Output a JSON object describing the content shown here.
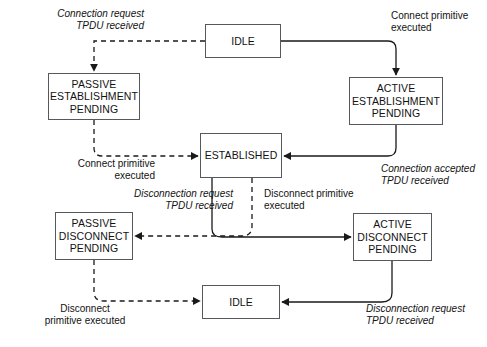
{
  "diagram": {
    "type": "state-transition-diagram",
    "colors": {
      "box_border": "#55585c",
      "solid_edge": "#1a1a1a",
      "dashed_edge": "#1a1a1a",
      "background": "#ffffff",
      "text": "#121212"
    },
    "legend": {
      "solid_edge_meaning": "transitions caused by local actions",
      "dashed_edge_meaning": "transitions caused by remote events"
    },
    "states": [
      {
        "id": "idle-top",
        "lines": [
          "IDLE"
        ],
        "x": 205,
        "y": 24,
        "w": 76,
        "h": 34
      },
      {
        "id": "passive-establishment-pending",
        "lines": [
          "PASSIVE",
          "ESTABLISHMENT",
          "PENDING"
        ],
        "x": 48,
        "y": 73,
        "w": 92,
        "h": 47
      },
      {
        "id": "active-establishment-pending",
        "lines": [
          "ACTIVE",
          "ESTABLISHMENT",
          "PENDING"
        ],
        "x": 349,
        "y": 77,
        "w": 94,
        "h": 48
      },
      {
        "id": "established",
        "lines": [
          "ESTABLISHED"
        ],
        "x": 200,
        "y": 133,
        "w": 82,
        "h": 45
      },
      {
        "id": "passive-disconnect-pending",
        "lines": [
          "PASSIVE",
          "DISCONNECT",
          "PENDING"
        ],
        "x": 55,
        "y": 212,
        "w": 78,
        "h": 48
      },
      {
        "id": "active-disconnect-pending",
        "lines": [
          "ACTIVE",
          "DISCONNECT",
          "PENDING"
        ],
        "x": 353,
        "y": 213,
        "w": 79,
        "h": 48
      },
      {
        "id": "idle-bottom",
        "lines": [
          "IDLE"
        ],
        "x": 202,
        "y": 285,
        "w": 78,
        "h": 34
      }
    ],
    "labels": [
      {
        "id": "connection-request-tpdu-received",
        "lines": [
          "Connection request",
          "TPDU received"
        ],
        "italic": true,
        "align": "right",
        "x": 14,
        "y": 8,
        "w": 130
      },
      {
        "id": "connect-primitive-executed-top",
        "lines": [
          "Connect primitive",
          "executed"
        ],
        "italic": false,
        "align": "left",
        "x": 391,
        "y": 10,
        "w": 96
      },
      {
        "id": "connect-primitive-executed-left",
        "lines": [
          "Connect primitive",
          "executed"
        ],
        "italic": false,
        "align": "right",
        "x": 45,
        "y": 158,
        "w": 110
      },
      {
        "id": "connection-accepted-tpdu-received",
        "lines": [
          "Connection accepted",
          "TPDU received"
        ],
        "italic": true,
        "align": "left",
        "x": 381,
        "y": 163,
        "w": 106
      },
      {
        "id": "disconnection-request-tpdu-received-mid",
        "lines": [
          "Disconnection request",
          "TPDU received"
        ],
        "italic": true,
        "align": "right",
        "x": 112,
        "y": 188,
        "w": 121
      },
      {
        "id": "disconnect-primitive-executed-mid",
        "lines": [
          "Disconnect primitive",
          "executed"
        ],
        "italic": false,
        "align": "left",
        "x": 264,
        "y": 188,
        "w": 112
      },
      {
        "id": "disconnect-primitive-executed-bottom",
        "lines": [
          "Disconnect",
          "primitive executed"
        ],
        "italic": false,
        "align": "center",
        "x": 19,
        "y": 303,
        "w": 132
      },
      {
        "id": "disconnection-request-tpdu-received-bottom",
        "lines": [
          "Disconnection request",
          "TPDU received"
        ],
        "italic": true,
        "align": "left",
        "x": 366,
        "y": 303,
        "w": 121
      }
    ],
    "transitions": [
      {
        "id": "idle-top-to-passive-establishment",
        "from": "idle-top",
        "to": "passive-establishment-pending",
        "style": "dashed",
        "label": "connection-request-tpdu-received"
      },
      {
        "id": "idle-top-to-active-establishment",
        "from": "idle-top",
        "to": "active-establishment-pending",
        "style": "solid",
        "label": "connect-primitive-executed-top"
      },
      {
        "id": "passive-establishment-to-established",
        "from": "passive-establishment-pending",
        "to": "established",
        "style": "dashed",
        "label": "connect-primitive-executed-left"
      },
      {
        "id": "active-establishment-to-established",
        "from": "active-establishment-pending",
        "to": "established",
        "style": "solid",
        "label": "connection-accepted-tpdu-received"
      },
      {
        "id": "established-to-passive-disconnect",
        "from": "established",
        "to": "passive-disconnect-pending",
        "style": "dashed",
        "label": "disconnection-request-tpdu-received-mid"
      },
      {
        "id": "established-to-active-disconnect",
        "from": "established",
        "to": "active-disconnect-pending",
        "style": "solid",
        "label": "disconnect-primitive-executed-mid"
      },
      {
        "id": "passive-disconnect-to-idle-bottom",
        "from": "passive-disconnect-pending",
        "to": "idle-bottom",
        "style": "dashed",
        "label": "disconnect-primitive-executed-bottom"
      },
      {
        "id": "active-disconnect-to-idle-bottom",
        "from": "active-disconnect-pending",
        "to": "idle-bottom",
        "style": "solid",
        "label": "disconnection-request-tpdu-received-bottom"
      }
    ]
  }
}
